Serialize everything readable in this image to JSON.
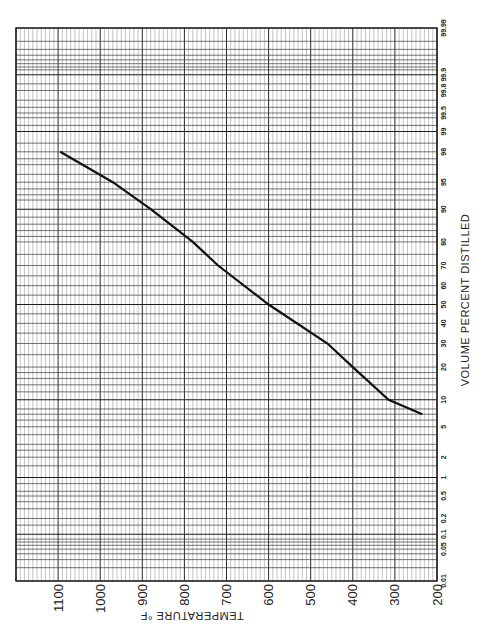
{
  "chart_data": {
    "type": "line",
    "title": "",
    "orientation": "rotated 90deg: temperature runs horizontally (decreasing left-to-right), percent distilled runs vertically on probability scale",
    "xlabel": "VOLUME PERCENT DISTILLED",
    "ylabel": "TEMPERATURE °F",
    "x_scale": "probability (normal)",
    "x_ticks": [
      "0.01",
      "0.05",
      "0.1",
      "0.2",
      "0.5",
      "1",
      "2",
      "5",
      "10",
      "20",
      "30",
      "40",
      "50",
      "60",
      "70",
      "80",
      "90",
      "95",
      "98",
      "99",
      "99.5",
      "99.8",
      "99.9",
      "99.99"
    ],
    "y_ticks": [
      "200",
      "300",
      "400",
      "500",
      "600",
      "700",
      "800",
      "900",
      "1000",
      "1100"
    ],
    "xlim": [
      0.01,
      99.99
    ],
    "ylim": [
      200,
      1200
    ],
    "grid": true,
    "legend": null,
    "series": [
      {
        "name": "Distillation curve",
        "x": [
          7,
          10,
          20,
          30,
          50,
          70,
          80,
          90,
          95,
          98
        ],
        "y": [
          235,
          315,
          400,
          460,
          600,
          720,
          780,
          880,
          970,
          1095
        ]
      }
    ]
  },
  "labels": {
    "x_axis_title": "VOLUME PERCENT DISTILLED",
    "y_axis_title": "TEMPERATURE °F"
  }
}
